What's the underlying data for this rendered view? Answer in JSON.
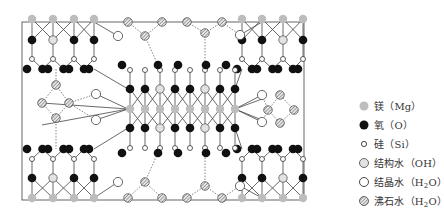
{
  "diagram": {
    "frame": {
      "x": 22,
      "y": 22,
      "w": 282,
      "h": 178
    },
    "colors": {
      "mg": "#b9b9b9",
      "oxygen": "#111111",
      "si_fill": "#ffffff",
      "stroke": "#333333",
      "hatch": "#888888",
      "frame": "#555555"
    }
  },
  "legend": {
    "items": [
      {
        "symbol": "mg",
        "label": "镁（Mg）"
      },
      {
        "symbol": "oxygen",
        "label": "氧（O）"
      },
      {
        "symbol": "si",
        "label": "硅（Si）"
      },
      {
        "symbol": "oh",
        "label": "结构水（OH）"
      },
      {
        "symbol": "h2o",
        "label": "结晶水（H",
        "sub": "2",
        "tail": "O）"
      },
      {
        "symbol": "zeolite",
        "label": "沸石水（H",
        "sub": "2",
        "tail": "O）"
      }
    ]
  }
}
